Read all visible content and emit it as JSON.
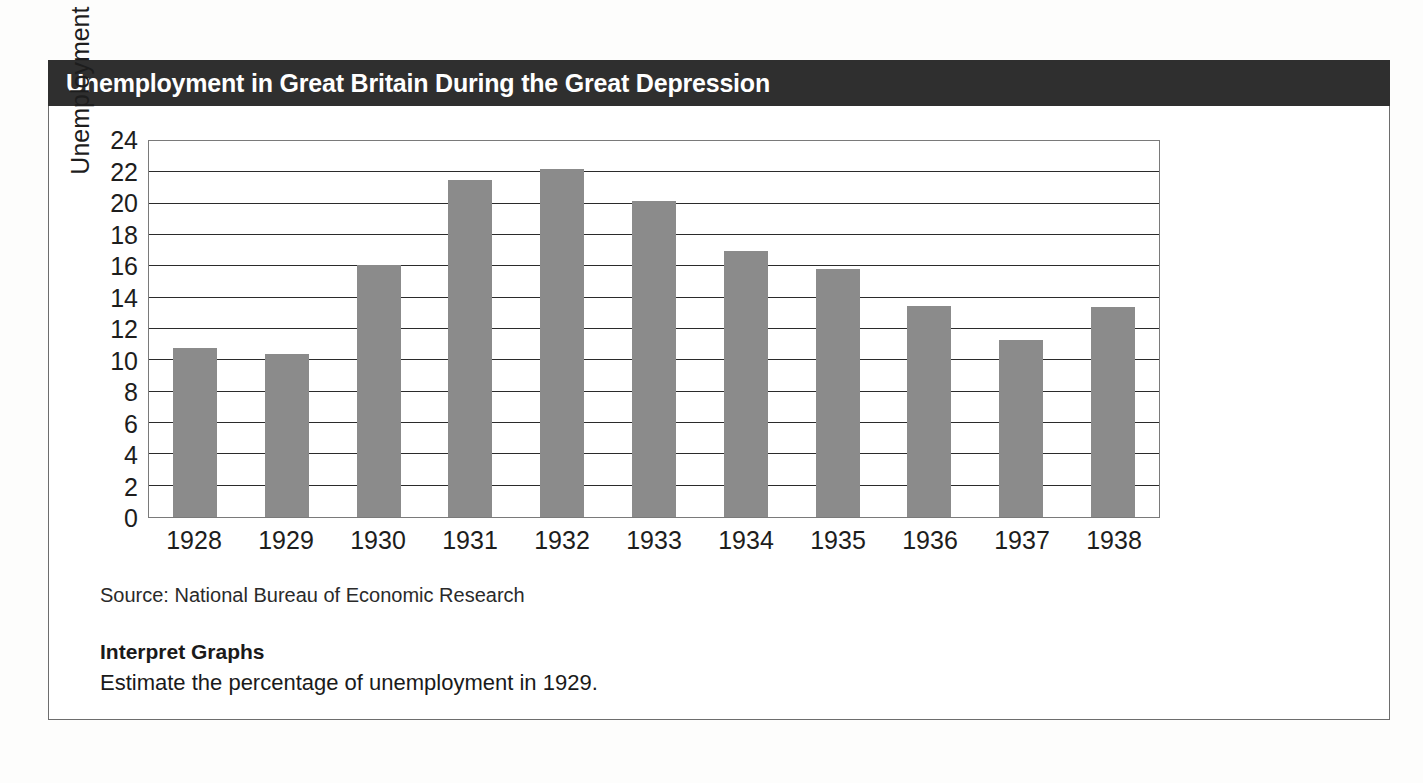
{
  "title": "Unemployment in Great Britain During the Great Depression",
  "source": "Source: National Bureau of Economic Research",
  "caption": {
    "heading": "Interpret Graphs",
    "question": "Estimate the percentage of unemployment in 1929."
  },
  "colors": {
    "banner_bg": "#2f2f2f",
    "banner_text": "#ffffff",
    "bar_fill": "#8b8b8b",
    "gridline": "#2b2b2b",
    "plot_border": "#7a7a7a",
    "card_border": "#6d6d6d"
  },
  "chart_data": {
    "type": "bar",
    "title": "Unemployment in Great Britain During the Great Depression",
    "xlabel": "",
    "ylabel": "Unemployment %",
    "categories": [
      "1928",
      "1929",
      "1930",
      "1931",
      "1932",
      "1933",
      "1934",
      "1935",
      "1936",
      "1937",
      "1938"
    ],
    "values": [
      10.8,
      10.4,
      16.1,
      21.5,
      22.2,
      20.2,
      17.0,
      15.8,
      13.5,
      11.3,
      13.4
    ],
    "ylim": [
      0,
      24
    ],
    "ytick_step": 2,
    "yticks": [
      24,
      22,
      20,
      18,
      16,
      14,
      12,
      10,
      8,
      6,
      4,
      2,
      0
    ],
    "grid": true,
    "grid_axis": "y",
    "legend": false,
    "orientation": "vertical"
  }
}
